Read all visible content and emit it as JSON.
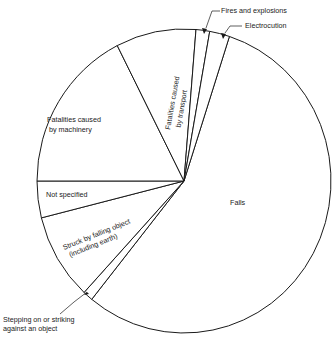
{
  "chart_data": {
    "type": "pie",
    "title": "",
    "start_angle_deg": 18,
    "direction": "clockwise",
    "legend": "none (direct labels)",
    "slices": [
      {
        "label": "Falls",
        "value": 55.8
      },
      {
        "label": "Stepping on or striking against an object",
        "value": 1.1
      },
      {
        "label": "Struck by falling object (including earth)",
        "value": 9.2
      },
      {
        "label": "Not specified",
        "value": 3.9
      },
      {
        "label": "Fatalities caused by machinery",
        "value": 17.5
      },
      {
        "label": "Fatalities caused by transport",
        "value": 8.8
      },
      {
        "label": "Fires and explosions",
        "value": 1.5
      },
      {
        "label": "Electrocution",
        "value": 2.2
      }
    ]
  },
  "labels": {
    "falls": "Falls",
    "stepping_line1": "Stepping on or striking",
    "stepping_line2": "against an object",
    "struck_line1": "Struck by falling object",
    "struck_line2": "(including earth)",
    "not_specified": "Not specified",
    "machinery_line1": "Fatalities caused",
    "machinery_line2": "by machinery",
    "transport_line1": "Fatalities caused",
    "transport_line2": "by transport",
    "fires": "Fires and explosions",
    "electrocution": "Electrocution"
  },
  "colors": {
    "stroke": "#1a1a1a",
    "fill": "#ffffff"
  }
}
